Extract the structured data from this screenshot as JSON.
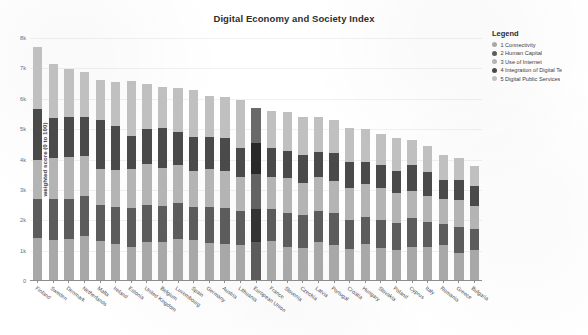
{
  "chart_data": {
    "type": "bar",
    "title": "Digital Economy and Society Index",
    "xlabel": "",
    "ylabel": "weighted score (0 to 100)",
    "ylim": [
      0,
      80
    ],
    "yticks": [
      "0",
      "1k",
      "2k",
      "3k",
      "4k",
      "5k",
      "6k",
      "7k",
      "8k"
    ],
    "ytick_values": [
      0,
      10,
      20,
      30,
      40,
      50,
      60,
      70,
      80
    ],
    "grid": true,
    "stacked": true,
    "legend_position": "top-right",
    "legend_title": "Legend",
    "highlighted_category": "European Union",
    "categories": [
      "Finland",
      "Sweden",
      "Denmark",
      "Netherlands",
      "Malta",
      "Ireland",
      "Estonia",
      "United Kingdom",
      "Belgium",
      "Luxembourg",
      "Spain",
      "Germany",
      "Austria",
      "Lithuania",
      "European Union",
      "France",
      "Slovenia",
      "Czechia",
      "Latvia",
      "Portugal",
      "Croatia",
      "Hungary",
      "Slovakia",
      "Poland",
      "Cyprus",
      "Italy",
      "Romania",
      "Greece",
      "Bulgaria"
    ],
    "series": [
      {
        "name": "1 Connectivity",
        "color": "#a8a8a8",
        "values": [
          13.8,
          13.2,
          13.6,
          14.6,
          13.0,
          11.8,
          11.0,
          12.6,
          12.6,
          13.4,
          13.2,
          12.2,
          12.0,
          11.6,
          12.4,
          13.0,
          11.0,
          10.6,
          12.6,
          11.6,
          10.2,
          11.8,
          10.4,
          9.8,
          10.8,
          11.0,
          11.4,
          9.0,
          10.0
        ]
      },
      {
        "name": "2 Human Capital",
        "color": "#5c5c5c",
        "values": [
          13.0,
          13.4,
          13.0,
          13.0,
          11.6,
          12.2,
          12.6,
          12.2,
          11.8,
          12.0,
          11.0,
          11.8,
          11.6,
          11.2,
          11.0,
          10.4,
          11.0,
          10.8,
          10.2,
          10.6,
          9.4,
          8.8,
          9.4,
          9.0,
          9.6,
          8.2,
          7.0,
          8.4,
          6.8
        ]
      },
      {
        "name": "3 Use of Internet",
        "color": "#b4b4b4",
        "values": [
          12.6,
          13.6,
          13.8,
          13.2,
          12.0,
          12.2,
          12.8,
          13.4,
          12.6,
          12.4,
          11.6,
          12.4,
          12.2,
          11.2,
          11.4,
          10.6,
          11.6,
          10.6,
          11.2,
          10.4,
          10.6,
          11.0,
          10.6,
          9.8,
          8.8,
          8.4,
          8.2,
          8.8,
          7.6
        ]
      },
      {
        "name": "4 Integration of Digital Te",
        "color": "#4a4a4a",
        "values": [
          17.0,
          13.2,
          13.4,
          13.0,
          16.0,
          14.4,
          11.0,
          11.6,
          13.0,
          11.0,
          11.4,
          10.6,
          11.0,
          9.6,
          10.4,
          9.6,
          9.0,
          9.2,
          8.2,
          9.2,
          8.6,
          7.4,
          7.6,
          7.4,
          8.6,
          8.0,
          6.2,
          6.6,
          6.4
        ]
      },
      {
        "name": "5 Digital Public Services",
        "color": "#c0c0c0",
        "values": [
          20.4,
          17.8,
          15.6,
          14.6,
          13.4,
          14.6,
          18.2,
          14.8,
          13.6,
          14.4,
          15.2,
          13.6,
          13.4,
          15.8,
          11.6,
          12.0,
          12.6,
          12.4,
          11.4,
          11.0,
          11.2,
          10.6,
          10.2,
          10.8,
          8.2,
          8.4,
          8.2,
          7.4,
          6.6
        ]
      }
    ]
  }
}
